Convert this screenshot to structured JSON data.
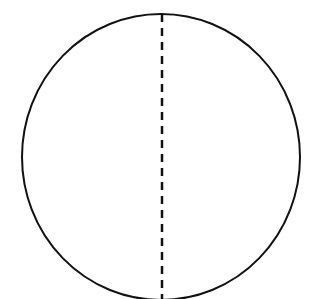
{
  "canvas": {
    "width": 322,
    "height": 299,
    "background": "#ffffff"
  },
  "diagram": {
    "shape": "circle",
    "stroke_color": "#111111",
    "circle": {
      "cx": 161,
      "cy": 157,
      "rx": 139,
      "ry": 143,
      "stroke_width": 2
    },
    "divider": {
      "style": "dashed",
      "x": 162,
      "y1": 14,
      "y2": 299,
      "stroke_width": 2.5,
      "dash": "8,6"
    }
  }
}
